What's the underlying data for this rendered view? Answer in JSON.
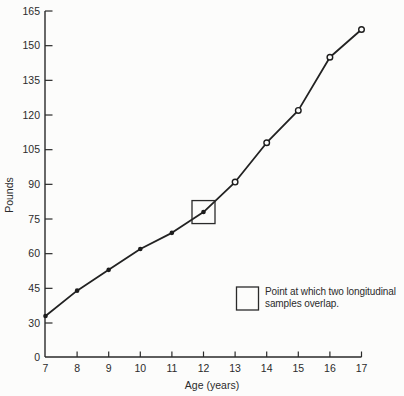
{
  "chart_data": {
    "type": "line",
    "title": "",
    "xlabel": "Age (years)",
    "ylabel": "Pounds",
    "x": [
      7,
      8,
      9,
      10,
      11,
      12,
      13,
      14,
      15,
      16,
      17
    ],
    "series": [
      {
        "name": "body-weight-by-age",
        "values": [
          33,
          44,
          53,
          62,
          69,
          78,
          91,
          108,
          122,
          145,
          157
        ],
        "filled_marker_x": [
          7,
          8,
          9,
          10,
          11,
          12
        ],
        "open_marker_x": [
          13,
          14,
          15,
          16,
          17
        ]
      }
    ],
    "y_ticks": [
      0,
      30,
      45,
      60,
      75,
      90,
      105,
      120,
      135,
      150,
      165
    ],
    "x_ticks": [
      7,
      8,
      9,
      10,
      11,
      12,
      13,
      14,
      15,
      16,
      17
    ],
    "axis_break": "y axis compressed between 0 and 30",
    "annotation": {
      "boxed_point_x": 12,
      "text": "Point at which two longitudinal samples overlap."
    },
    "legend": {
      "line1": "Point at which two longitudinal",
      "line2": "samples overlap.",
      "position": "lower-right"
    },
    "grid": false,
    "colors": {
      "line": "#222222",
      "text": "#2b2b2b",
      "background": "#fcfcfb"
    }
  }
}
